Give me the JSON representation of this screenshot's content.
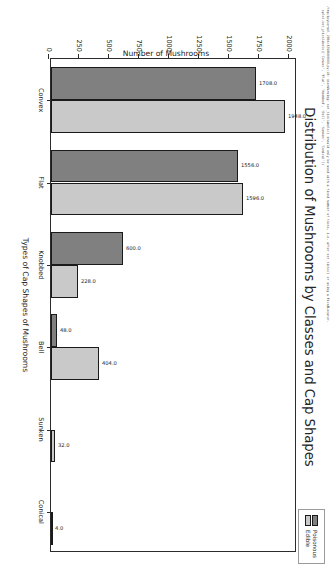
{
  "warning_text": "/tmp/ipykernel_2866/4258604443.py:18: UserWarning: set_ticklabels() should only be used with a fixed number of ticks, i.e. after set_ticks() or using a FixedLocator.\n  splot.set_yticklabels(['Convex', 'Flat', 'Knobbed', 'Bell', 'Sunken', 'Conical'])",
  "legend": {
    "items": [
      {
        "label": "Poisonous",
        "color": "#808080"
      },
      {
        "label": "Edible",
        "color": "#c9c9c9"
      }
    ]
  },
  "chart_data": {
    "type": "bar",
    "orientation": "vertical",
    "title": "Distribution of Mushrooms by Classes and Cap Shapes",
    "xlabel": "Types of Cap Shapes of Mushrooms",
    "ylabel": "Number of Mushrooms",
    "categories": [
      "Convex",
      "Flat",
      "Knobbed",
      "Bell",
      "Sunken",
      "Conical"
    ],
    "series": [
      {
        "name": "Poisonous",
        "color": "#808080",
        "values": [
          1708.0,
          1556.0,
          600.0,
          48.0,
          0.0,
          0.0
        ],
        "labels": [
          "1708.0",
          "1556.0",
          "600.0",
          "48.0",
          "",
          ""
        ]
      },
      {
        "name": "Edible",
        "color": "#c9c9c9",
        "values": [
          1948.0,
          1596.0,
          228.0,
          404.0,
          32.0,
          4.0
        ],
        "labels": [
          "1948.0",
          "1596.0",
          "228.0",
          "404.0",
          "32.0",
          "4.0"
        ]
      }
    ],
    "yticks": [
      0,
      250,
      500,
      750,
      1000,
      1250,
      1500,
      1750,
      2000
    ],
    "ytick_labels": [
      "0",
      "250",
      "500",
      "750",
      "1000",
      "1250",
      "1500",
      "1750",
      "2000"
    ],
    "ylim": [
      0,
      2050
    ],
    "grid": false,
    "legend_position": "upper right"
  }
}
